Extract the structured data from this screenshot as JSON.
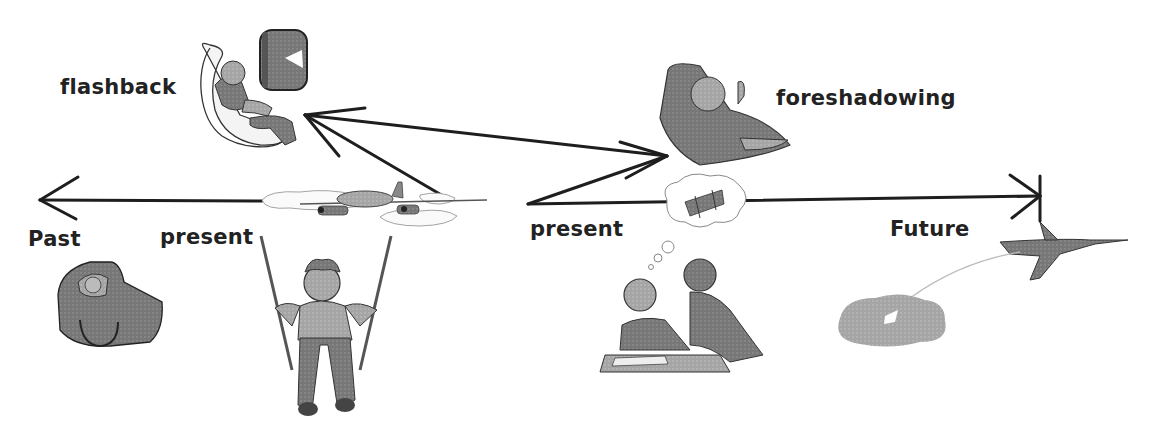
{
  "diagram": {
    "labels": {
      "flashback": "flashback",
      "foreshadowing": "foreshadowing",
      "past": "Past",
      "present_left": "present",
      "present_right": "present",
      "future": "Future"
    },
    "illustrations": [
      {
        "id": "child-in-airplane-seat",
        "caption": ""
      },
      {
        "id": "airplane-window",
        "caption": ""
      },
      {
        "id": "pilot-in-cockpit",
        "caption": ""
      },
      {
        "id": "propeller-plane-in-clouds",
        "caption": ""
      },
      {
        "id": "baby-in-bassinet",
        "caption": ""
      },
      {
        "id": "boy-on-swing",
        "caption": ""
      },
      {
        "id": "student-and-teacher-with-thought-bubble-biplane",
        "caption": ""
      },
      {
        "id": "fighter-jet-with-ejected-cloud",
        "caption": ""
      }
    ],
    "colors": {
      "line": "#1e1e1e",
      "figure": "#6e6e6e",
      "figure_light": "#a8a8a8",
      "background": "#ffffff"
    }
  }
}
